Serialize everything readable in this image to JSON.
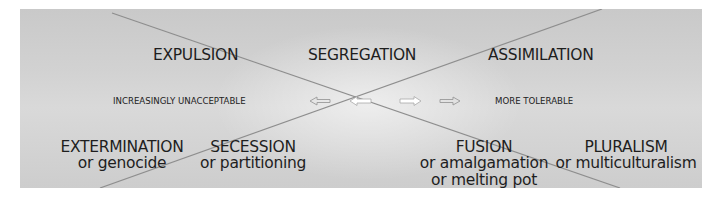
{
  "diagram": {
    "top_row": [
      {
        "id": "expulsion",
        "title": "EXPULSION"
      },
      {
        "id": "segregation",
        "title": "SEGREGATION"
      },
      {
        "id": "assimilation",
        "title": "ASSIMILATION"
      }
    ],
    "bottom_row": [
      {
        "id": "extermination",
        "title": "EXTERMINATION",
        "sub1": "or genocide"
      },
      {
        "id": "secession",
        "title": "SECESSION",
        "sub1": "or partitioning"
      },
      {
        "id": "fusion",
        "title": "FUSION",
        "sub1": "or amalgamation",
        "sub2": "or melting pot"
      },
      {
        "id": "pluralism",
        "title": "PLURALISM",
        "sub1": "or multiculturalism"
      }
    ],
    "axis": {
      "left_label": "INCREASINGLY UNACCEPTABLE",
      "right_label": "MORE TOLERABLE",
      "arrows": [
        "left-outline-arrow",
        "left-solid-arrow",
        "right-solid-arrow",
        "right-outline-arrow"
      ]
    },
    "colors": {
      "background": "#d2d2d2",
      "line": "#8a8a8a",
      "text": "#1e1e1e",
      "arrow_fill": "#ffffff"
    }
  }
}
